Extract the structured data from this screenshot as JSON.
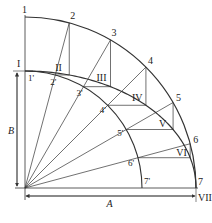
{
  "diagram": {
    "center": {
      "x": 25,
      "y": 188
    },
    "outer_radius_A": 171,
    "inner_radius_B": 117,
    "angles_deg": [
      90,
      75,
      60,
      45,
      30,
      15,
      0
    ],
    "outer_points": [
      "1",
      "2",
      "3",
      "4",
      "5",
      "6",
      "7"
    ],
    "inner_points": [
      "1'",
      "2'",
      "3'",
      "4'",
      "5'",
      "6'",
      "7'"
    ],
    "ellipse_points": [
      "I",
      "II",
      "III",
      "IV",
      "V",
      "VI",
      "VII"
    ],
    "dimensions": {
      "horizontal": "A",
      "vertical": "B"
    },
    "colors": {
      "line": "#333333",
      "background": "#ffffff"
    }
  }
}
